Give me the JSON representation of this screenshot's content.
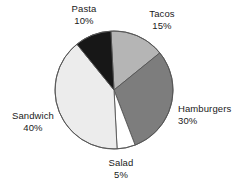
{
  "chart_data": {
    "type": "pie",
    "title": "",
    "subtitle": "",
    "xlabel": "",
    "ylabel": "",
    "legend_position": "none",
    "labels_position": "outside",
    "grid": false,
    "unit": "%",
    "categories": [
      "Tacos",
      "Hamburgers",
      "Salad",
      "Sandwich",
      "Pasta"
    ],
    "values": [
      15,
      30,
      5,
      40,
      10
    ],
    "start_angle_deg": -3,
    "direction": "clockwise",
    "slices": [
      {
        "name": "Tacos",
        "label": "Tacos",
        "value": 15,
        "value_label": "15%",
        "color": "#b5b5b5",
        "start_angle_deg": -3,
        "end_angle_deg": 51
      },
      {
        "name": "Hamburgers",
        "label": "Hamburgers",
        "value": 30,
        "value_label": "30%",
        "color": "#7d7d7d",
        "start_angle_deg": 51,
        "end_angle_deg": 159
      },
      {
        "name": "Salad",
        "label": "Salad",
        "value": 5,
        "value_label": "5%",
        "color": "#ffffff",
        "start_angle_deg": 159,
        "end_angle_deg": 177
      },
      {
        "name": "Sandwich",
        "label": "Sandwich",
        "value": 40,
        "value_label": "40%",
        "color": "#ececec",
        "start_angle_deg": 177,
        "end_angle_deg": 321
      },
      {
        "name": "Pasta",
        "label": "Pasta",
        "value": 10,
        "value_label": "10%",
        "color": "#171717",
        "start_angle_deg": 321,
        "end_angle_deg": 357
      }
    ],
    "geometry": {
      "center_x": 114,
      "center_y": 90,
      "radius": 59,
      "outline_color": "#555555",
      "outline_width": 0.9
    }
  },
  "labels": {
    "pasta": {
      "name": "Pasta",
      "value": "10%"
    },
    "tacos": {
      "name": "Tacos",
      "value": "15%"
    },
    "hamburgers": {
      "name": "Hamburgers",
      "value": "30%"
    },
    "sandwich": {
      "name": "Sandwich",
      "value": "40%"
    },
    "salad": {
      "name": "Salad",
      "value": "5%"
    }
  }
}
